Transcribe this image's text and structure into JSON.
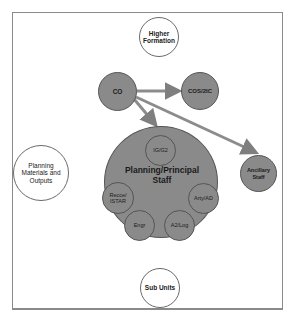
{
  "diagram": {
    "top_cut_text": "",
    "colors": {
      "frame": "#8a8a8a",
      "grey_node": "#8a8a8a",
      "white_node": "#ffffff",
      "arrow": "#7f7f7f"
    },
    "nodes": {
      "higher_formation": "Higher Formation",
      "co": "CO",
      "cos_2ic": "COS/2IC",
      "planning_staff": "Planning/Principal Staff",
      "ig_g2": "IG/G2",
      "recce_istar": "Recce/ ISTAR",
      "arty_ad": "Arty/AD",
      "engr": "Engr",
      "a2_log": "A2/Log",
      "ancillary_staff": "Ancillary Staff",
      "planning_materials": "Planning Materials and Outputs",
      "sub_units": "Sub Units"
    },
    "arrows": [
      {
        "from": "CO",
        "to": "COS/2IC"
      },
      {
        "from": "CO",
        "to": "Planning/Principal Staff"
      },
      {
        "from": "CO",
        "to": "Ancillary Staff"
      }
    ]
  }
}
